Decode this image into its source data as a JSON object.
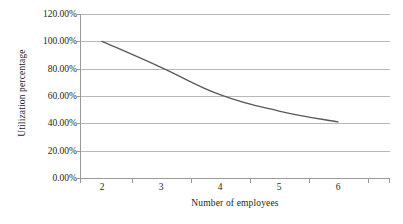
{
  "chart_data": {
    "type": "line",
    "title": "",
    "xlabel": "Number of employees",
    "ylabel": "Utilization percentage",
    "categories": [
      "2",
      "3",
      "4",
      "5",
      "6"
    ],
    "x": [
      2,
      3,
      4,
      5,
      6
    ],
    "values": [
      1.0,
      0.81,
      0.61,
      0.49,
      0.41
    ],
    "value_labels": [
      "100.00%",
      "81.00%",
      "61.00%",
      "49.00%",
      "41.00%"
    ],
    "ylim": [
      0,
      1.2
    ],
    "ytick_values": [
      0,
      0.2,
      0.4,
      0.6,
      0.8,
      1.0,
      1.2
    ],
    "ytick_labels": [
      "0.00%",
      "20.00%",
      "40.00%",
      "60.00%",
      "80.00%",
      "100.00%",
      "120.00%"
    ],
    "xtick_labels": [
      "2",
      "3",
      "4",
      "5",
      "6"
    ],
    "grid": "horizontal",
    "legend": "none",
    "series_color": "#595959",
    "gridline_color": "#b8b8b8",
    "axis_color": "#9a9a9a",
    "background_color": "#ffffff",
    "markers": "none",
    "smoothing": "smooth"
  }
}
